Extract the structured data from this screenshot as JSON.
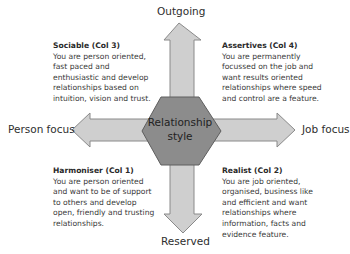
{
  "center": {
    "line1": "Relationship",
    "line2": "style"
  },
  "axes": {
    "top": "Outgoing",
    "bottom": "Reserved",
    "left": "Person focus",
    "right": "Job focus"
  },
  "quadrants": {
    "top_left": {
      "title": "Sociable (Col 3)",
      "body": "You are person oriented, fast paced and enthusiastic and develop relationships based on intuition, vision and trust."
    },
    "top_right": {
      "title": "Assertives (Col 4)",
      "body": "You are permanently focussed on the job and want results oriented relationships where speed and control are a feature."
    },
    "bottom_left": {
      "title": "Harmoniser (Col 1)",
      "body": "You are person oriented and want to be of support to others and develop open, friendly and trusting relationships."
    },
    "bottom_right": {
      "title": "Realist (Col 2)",
      "body": "You are job oriented, organised, business like and efficient and want relationships where information, facts and evidence feature."
    }
  },
  "colors": {
    "arrow_fill": "#cfcfcf",
    "arrow_stroke": "#8a8a8a",
    "hex_fill": "#8c8c8c",
    "hex_stroke": "#5e5e5e"
  }
}
